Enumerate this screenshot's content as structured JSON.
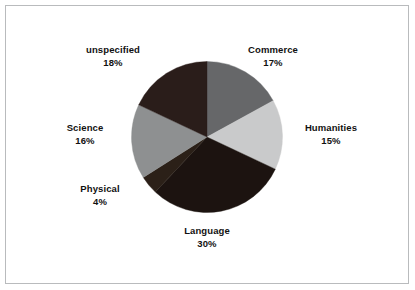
{
  "figure": {
    "background_color": "#ffffff",
    "frame_color": "#b9bbbd",
    "label_text_color": "#111111"
  },
  "chart_data": {
    "type": "pie",
    "title": "",
    "subtitle": "",
    "xlabel": "",
    "ylabel": "",
    "legend_position": "none",
    "labels_position": "outside",
    "grid": false,
    "start_angle_deg": 0,
    "direction": "clockwise",
    "total": 100,
    "units": "%",
    "categories": [
      "Commerce",
      "Humanities",
      "Language",
      "Physical",
      "Science",
      "unspecified"
    ],
    "values": [
      17,
      15,
      30,
      4,
      16,
      18
    ],
    "colors": [
      "#666769",
      "#c9cacb",
      "#1c1310",
      "#2b2018",
      "#8e9091",
      "#2a1d1a"
    ],
    "slices": [
      {
        "label": "Commerce",
        "value": 17,
        "value_text": "17%",
        "color": "#666769",
        "start_deg": 0,
        "end_deg": 61.2
      },
      {
        "label": "Humanities",
        "value": 15,
        "value_text": "15%",
        "color": "#c9cacb",
        "start_deg": 61.2,
        "end_deg": 115.2
      },
      {
        "label": "Language",
        "value": 30,
        "value_text": "30%",
        "color": "#1c1310",
        "start_deg": 115.2,
        "end_deg": 223.2
      },
      {
        "label": "Physical",
        "value": 4,
        "value_text": "4%",
        "color": "#2b2018",
        "start_deg": 223.2,
        "end_deg": 237.6
      },
      {
        "label": "Science",
        "value": 16,
        "value_text": "16%",
        "color": "#8e9091",
        "start_deg": 237.6,
        "end_deg": 295.2
      },
      {
        "label": "unspecified",
        "value": 18,
        "value_text": "18%",
        "color": "#2a1d1a",
        "start_deg": 295.2,
        "end_deg": 360
      }
    ]
  }
}
